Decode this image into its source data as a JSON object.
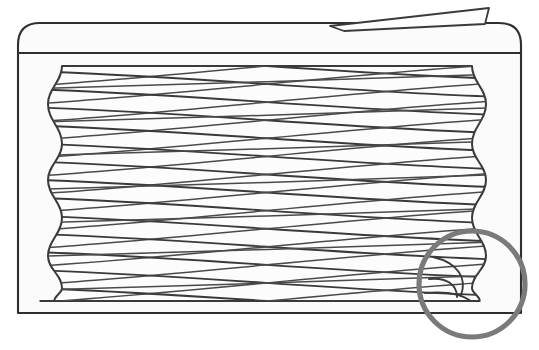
{
  "figure": {
    "kind": "technical-line-drawing",
    "canvas": {
      "width": 539,
      "height": 350
    },
    "background_color": "#ffffff",
    "line_color": "#3a3a3a",
    "frame_line_color": "#2f2f2f",
    "interior_fill": "#fbfbfb",
    "callout_color": "#7a7a7a"
  },
  "housing": {
    "name": "outer-housing",
    "shape": "rounded-rectangle-open-bottom",
    "left": 18,
    "right": 521,
    "top": 23,
    "bottom": 313,
    "corner_radius": 22,
    "inner_shelf_y": 53
  },
  "coil": {
    "name": "helical-coil",
    "left": 48,
    "right": 486,
    "top": 66,
    "bottom": 301,
    "turn_count": 7,
    "crossing_line_count": 14,
    "profile": "barrel-waisted",
    "bulge_y_positions": [
      104,
      180,
      256
    ],
    "waist_y_positions": [
      144,
      218,
      288
    ],
    "edge_amplitude": 14
  },
  "lead_end": {
    "name": "tapered-wire-lead",
    "description": "tapered wire end exiting above the housing at upper right",
    "tip_x": 489,
    "tip_y": 8,
    "base_x": 330,
    "base_y": 22
  },
  "terminal_end": {
    "name": "coil-terminal-end",
    "description": "ground/closed coil end at lower right inside the callout",
    "x": 455,
    "y": 283
  },
  "callout": {
    "name": "detail-callout-circle",
    "center_x": 472,
    "center_y": 284,
    "radius": 53,
    "stroke_width": 5.2,
    "color": "#7a7a7a"
  }
}
